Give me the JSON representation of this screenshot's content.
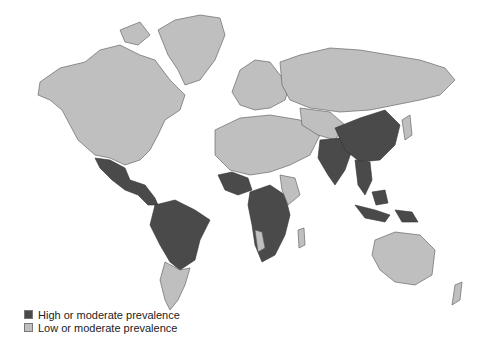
{
  "map": {
    "type": "choropleth world map",
    "projection": "Mercator",
    "colors": {
      "high": "#4a4a4a",
      "low": "#bfbfbf",
      "background": "#ffffff"
    },
    "high_regions": [
      "Mexico",
      "Central America",
      "Northern/Central South America (Brazil, Peru, Bolivia, Colombia, Venezuela)",
      "West Africa",
      "Central & Southern Africa",
      "India",
      "China",
      "Southeast Asia",
      "Indonesia",
      "Papua New Guinea"
    ],
    "low_regions": [
      "North America",
      "Greenland",
      "Europe",
      "Russia",
      "North Africa",
      "Middle East",
      "Central Asia",
      "Japan",
      "Australia",
      "New Zealand",
      "Southern South America"
    ]
  },
  "legend": {
    "items": [
      {
        "label": "High or moderate prevalence",
        "color": "#4a4a4a"
      },
      {
        "label": "Low or moderate prevalence",
        "color": "#bfbfbf"
      }
    ]
  }
}
